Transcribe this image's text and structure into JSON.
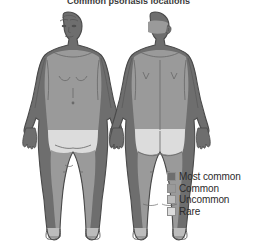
{
  "title": {
    "text": "Common psoriasis locations",
    "visible_fragment": "truncated at top edge"
  },
  "legend": {
    "position": "bottom-right",
    "items": [
      {
        "label": "Most common",
        "color": "#6e6e6e",
        "rank": 1
      },
      {
        "label": "Common",
        "color": "#9a9a9a",
        "rank": 2
      },
      {
        "label": "Uncommon",
        "color": "#bcbcbc",
        "rank": 3
      },
      {
        "label": "Rare",
        "color": "#dcdcdc",
        "rank": 4
      }
    ]
  },
  "figures": [
    {
      "name": "anterior-body-figure",
      "view": "front",
      "regions": [
        {
          "region": "head-face",
          "level": "Most common",
          "color": "#6e6e6e"
        },
        {
          "region": "neck",
          "level": "Most common",
          "color": "#6e6e6e"
        },
        {
          "region": "shoulders",
          "level": "Most common",
          "color": "#6e6e6e"
        },
        {
          "region": "arms",
          "level": "Most common",
          "color": "#6e6e6e"
        },
        {
          "region": "hands",
          "level": "Most common",
          "color": "#6e6e6e"
        },
        {
          "region": "chest-abdomen",
          "level": "Common",
          "color": "#9a9a9a"
        },
        {
          "region": "groin",
          "level": "Rare",
          "color": "#dcdcdc"
        },
        {
          "region": "legs",
          "level": "Common",
          "color": "#9a9a9a"
        },
        {
          "region": "knees",
          "level": "Common",
          "color": "#9a9a9a"
        },
        {
          "region": "feet",
          "level": "Uncommon",
          "color": "#bcbcbc"
        }
      ]
    },
    {
      "name": "posterior-body-figure",
      "view": "back",
      "regions": [
        {
          "region": "scalp",
          "level": "Most common",
          "color": "#6e6e6e"
        },
        {
          "region": "neck",
          "level": "Most common",
          "color": "#6e6e6e"
        },
        {
          "region": "shoulders",
          "level": "Most common",
          "color": "#6e6e6e"
        },
        {
          "region": "arms",
          "level": "Most common",
          "color": "#6e6e6e"
        },
        {
          "region": "hands",
          "level": "Most common",
          "color": "#6e6e6e"
        },
        {
          "region": "upper-back",
          "level": "Common",
          "color": "#9a9a9a"
        },
        {
          "region": "lower-back",
          "level": "Common",
          "color": "#9a9a9a"
        },
        {
          "region": "buttocks",
          "level": "Rare",
          "color": "#dcdcdc"
        },
        {
          "region": "legs",
          "level": "Common",
          "color": "#9a9a9a"
        },
        {
          "region": "feet",
          "level": "Uncommon",
          "color": "#bcbcbc"
        }
      ]
    }
  ],
  "colors": {
    "background": "#ffffff",
    "outline": "#4a4a4a",
    "shadow": "#5e5e5e",
    "text": "#2b2b2b"
  }
}
